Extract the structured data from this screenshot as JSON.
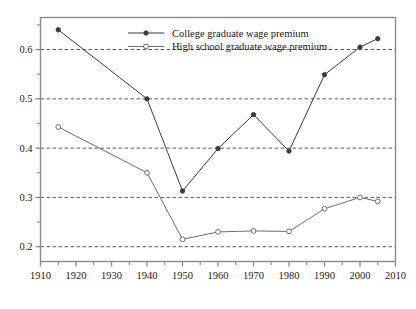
{
  "chart_data": {
    "type": "line",
    "title": "",
    "subtitle": "",
    "xlabel": "",
    "ylabel": "",
    "xlim": [
      1910,
      2010
    ],
    "ylim": [
      0.17,
      0.665
    ],
    "x_ticks": [
      1910,
      1920,
      1930,
      1940,
      1950,
      1960,
      1970,
      1980,
      1990,
      2000,
      2010
    ],
    "x_tick_labels": [
      "1910",
      "1920",
      "1930",
      "1940",
      "1950",
      "1960",
      "1970",
      "1980",
      "1990",
      "2000",
      "2010"
    ],
    "x_minor_ticks": [
      1915,
      1925,
      1935,
      1945,
      1955,
      1965,
      1975,
      1985,
      1995,
      2005
    ],
    "y_ticks": [
      0.2,
      0.3,
      0.4,
      0.5,
      0.6
    ],
    "y_tick_labels": [
      "0.2",
      "0.3",
      "0.4",
      "0.5",
      "0.6"
    ],
    "y_minor_ticks": [
      0.25,
      0.35,
      0.45,
      0.55,
      0.65
    ],
    "grid": "horizontal-dashed",
    "legend_position": "top-center",
    "x": [
      1915,
      1940,
      1950,
      1960,
      1970,
      1980,
      1990,
      2000,
      2005
    ],
    "series": [
      {
        "name": "College graduate wage premium",
        "marker": "filled-circle",
        "color": "#3b3b3b",
        "values": [
          0.64,
          0.5,
          0.313,
          0.399,
          0.468,
          0.394,
          0.549,
          0.605,
          0.622
        ]
      },
      {
        "name": "High school graduate wage premium",
        "marker": "open-circle",
        "color": "#6e6e6e",
        "values": [
          0.443,
          0.35,
          0.215,
          0.23,
          0.232,
          0.231,
          0.277,
          0.3,
          0.292
        ]
      }
    ]
  },
  "legend": {
    "entries": [
      {
        "label": "College graduate wage premium",
        "marker": "filled-circle"
      },
      {
        "label": "High school graduate wage premium",
        "marker": "open-circle"
      }
    ]
  },
  "colors": {
    "frame": "#8a8a8a",
    "grid": "#4a4a4a",
    "series_college": "#3b3b3b",
    "series_highschool": "#6e6e6e",
    "text": "#222222",
    "background": "#ffffff"
  }
}
